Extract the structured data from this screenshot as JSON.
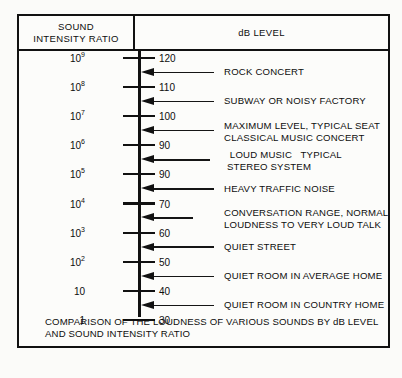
{
  "figure": {
    "columns": {
      "ratio_header_line1": "SOUND",
      "ratio_header_line2": "INTENSITY RATIO",
      "db_header": "dB LEVEL"
    },
    "caption_line1": "COMPARISON OF THE LOUDNESS OF VARIOUS SOUNDS BY dB LEVEL",
    "caption_line2": "AND SOUND INTENSITY RATIO"
  },
  "chart_data": {
    "type": "table",
    "title": "COMPARISON OF THE LOUDNESS OF VARIOUS SOUNDS BY dB LEVEL AND SOUND INTENSITY RATIO",
    "xlabel": "",
    "ylabel": "dB LEVEL",
    "orientation": "vertical-scale",
    "grid": false,
    "legend": "none",
    "axis_columns": [
      "SOUND INTENSITY RATIO",
      "dB LEVEL"
    ],
    "scale_ticks": [
      {
        "ratio_base": "10",
        "ratio_exp": "9",
        "db": "120"
      },
      {
        "ratio_base": "10",
        "ratio_exp": "8",
        "db": "110"
      },
      {
        "ratio_base": "10",
        "ratio_exp": "7",
        "db": "100"
      },
      {
        "ratio_base": "10",
        "ratio_exp": "6",
        "db": "90"
      },
      {
        "ratio_base": "10",
        "ratio_exp": "5",
        "db": "90"
      },
      {
        "ratio_base": "10",
        "ratio_exp": "4",
        "db": "70"
      },
      {
        "ratio_base": "10",
        "ratio_exp": "3",
        "db": "60"
      },
      {
        "ratio_base": "10",
        "ratio_exp": "2",
        "db": "50"
      },
      {
        "ratio_base": "10",
        "ratio_exp": "",
        "db": "40"
      },
      {
        "ratio_base": "1",
        "ratio_exp": "",
        "db": "30"
      }
    ],
    "annotations": [
      {
        "text_line1": "ROCK CONCERT",
        "text_line2": ""
      },
      {
        "text_line1": "SUBWAY OR NOISY FACTORY",
        "text_line2": ""
      },
      {
        "text_line1": "MAXIMUM LEVEL, TYPICAL SEAT",
        "text_line2": "CLASSICAL MUSIC CONCERT"
      },
      {
        "text_line1": " LOUD MUSIC   TYPICAL",
        "text_line2": "STEREO SYSTEM"
      },
      {
        "text_line1": "HEAVY TRAFFIC NOISE",
        "text_line2": ""
      },
      {
        "text_line1": "CONVERSATION RANGE, NORMAL",
        "text_line2": "LOUDNESS TO VERY LOUD TALK"
      },
      {
        "text_line1": "QUIET STREET",
        "text_line2": ""
      },
      {
        "text_line1": "QUIET ROOM IN AVERAGE HOME",
        "text_line2": ""
      },
      {
        "text_line1": "QUIET ROOM IN COUNTRY HOME",
        "text_line2": ""
      }
    ]
  }
}
